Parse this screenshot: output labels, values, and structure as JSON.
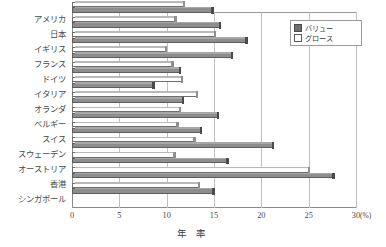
{
  "chart_data": {
    "type": "bar",
    "orientation": "horizontal",
    "title": "",
    "xlabel": "年 率",
    "ylabel": "",
    "xunit": "(%)",
    "xlim": [
      0,
      30
    ],
    "xticks": [
      0,
      5,
      10,
      15,
      20,
      25,
      30
    ],
    "grid": true,
    "legend_position": "top-right",
    "categories": [
      "アメリカ",
      "日本",
      "イギリス",
      "フランス",
      "ドイツ",
      "イタリア",
      "オランダ",
      "ベルギー",
      "スイス",
      "スウェーデン",
      "オーストリア",
      "香港",
      "シンガポール"
    ],
    "series": [
      {
        "name": "バリュー",
        "color": "#8d8d8d",
        "values": [
          14.8,
          15.6,
          18.4,
          16.9,
          11.4,
          8.6,
          11.7,
          15.4,
          13.6,
          21.2,
          16.4,
          27.6,
          14.9
        ]
      },
      {
        "name": "グロース",
        "color": "#ffffff",
        "values": [
          11.8,
          10.9,
          15.1,
          9.9,
          10.6,
          11.6,
          13.2,
          11.4,
          11.1,
          12.9,
          10.8,
          25.0,
          13.4
        ]
      }
    ]
  },
  "legend": {
    "items": [
      {
        "label": "バリュー",
        "swatch": "filled-square"
      },
      {
        "label": "グロース",
        "swatch": "open-square"
      }
    ]
  }
}
